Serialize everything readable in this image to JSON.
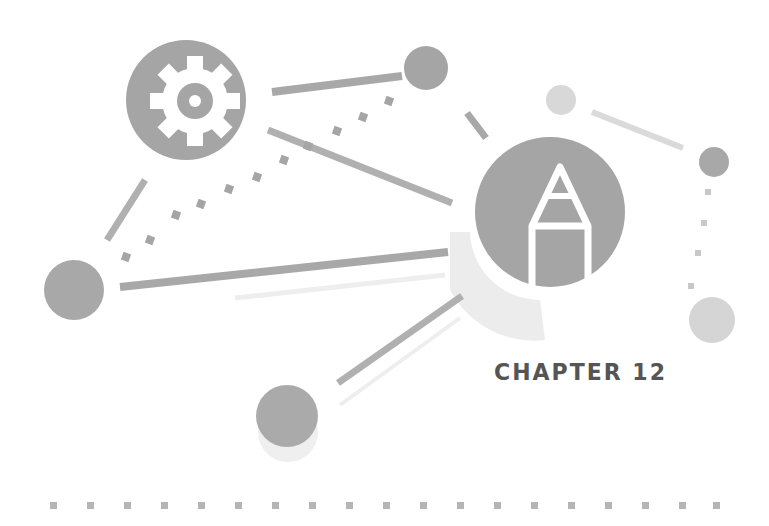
{
  "chapter": {
    "label": "CHAPTER 12"
  },
  "icons": {
    "gear": "gear-icon",
    "pencil": "pencil-icon"
  },
  "colors": {
    "dark": "#9a9a9a",
    "medium": "#b4b4b4",
    "light": "#d6d6d6",
    "faint": "#e6e6e6",
    "text": "#555555"
  },
  "footer": {
    "dot_count": 19
  }
}
